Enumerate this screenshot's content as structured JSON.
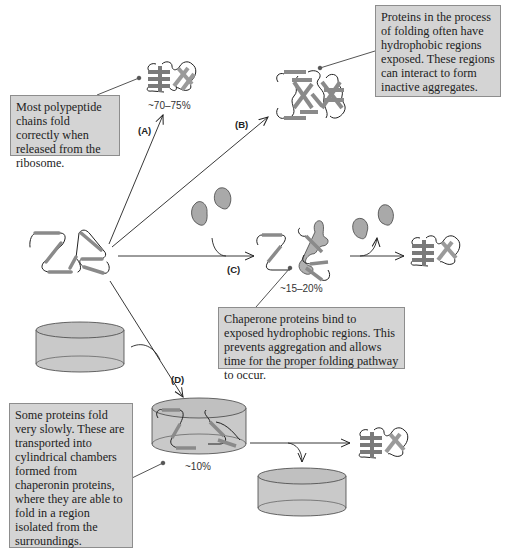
{
  "figure": {
    "pathways": [
      {
        "id": "A",
        "label": "(A)",
        "percentage": "~70–75%",
        "outcome": "correctly folded protein"
      },
      {
        "id": "B",
        "label": "(B)",
        "percentage": "",
        "outcome": "inactive aggregate"
      },
      {
        "id": "C",
        "label": "(C)",
        "percentage": "~15–20%",
        "outcome": "chaperone-assisted folding"
      },
      {
        "id": "D",
        "label": "(D)",
        "percentage": "~10%",
        "outcome": "chaperonin chamber folding"
      }
    ],
    "callouts": {
      "most_fold": "Most polypeptide chains fold correctly when released from the ribosome.",
      "aggregates": "Proteins in the process of folding often have hydrophobic regions exposed. These regions can interact to form inactive aggregates.",
      "chaperone": "Chaperone proteins bind to exposed hydrophobic regions. This prevents aggregation and allows time for the proper folding pathway to occur.",
      "chaperonin": "Some proteins fold very slowly. These are transported into cylindrical chambers formed from chaperonin proteins, where they are able to fold in a region isolated from the surroundings."
    }
  },
  "colors": {
    "callout_bg": "#d4d4d4",
    "callout_border": "#8d8d8d",
    "helix": "#8a8a8a",
    "chaperone": "#a9a9a9",
    "cylinder": "#c9c9c9",
    "line": "#222222"
  }
}
